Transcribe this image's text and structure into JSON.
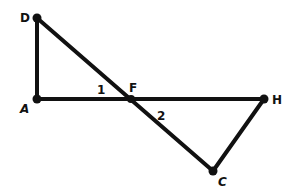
{
  "diagram": {
    "type": "geometry",
    "colors": {
      "stroke": "#111111",
      "background": "#ffffff"
    },
    "points": {
      "D": {
        "label": "D",
        "x": 37,
        "y": 18
      },
      "A": {
        "label": "A",
        "x": 37,
        "y": 99
      },
      "F": {
        "label": "F",
        "x": 131,
        "y": 99
      },
      "H": {
        "label": "H",
        "x": 264,
        "y": 99
      },
      "C": {
        "label": "C",
        "x": 213,
        "y": 171
      }
    },
    "segments": [
      {
        "from": "D",
        "to": "A"
      },
      {
        "from": "A",
        "to": "H"
      },
      {
        "from": "D",
        "to": "C"
      },
      {
        "from": "H",
        "to": "C"
      }
    ],
    "angle_labels": [
      {
        "label": "1",
        "at": "F",
        "between": [
          "A",
          "D"
        ]
      },
      {
        "label": "2",
        "at": "F",
        "between": [
          "H",
          "C"
        ]
      }
    ]
  }
}
